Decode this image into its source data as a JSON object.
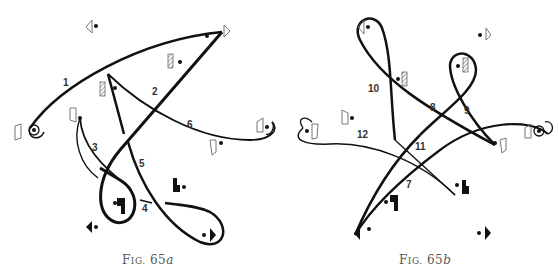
{
  "figures": [
    {
      "id": "a",
      "caption": {
        "prefix": "F",
        "smallcaps": "IG.",
        "number": "65",
        "suffix": "a"
      },
      "paths": [
        {
          "label": "1"
        },
        {
          "label": "2"
        },
        {
          "label": "3"
        },
        {
          "label": "4"
        },
        {
          "label": "5"
        },
        {
          "label": "6"
        }
      ]
    },
    {
      "id": "b",
      "caption": {
        "prefix": "F",
        "smallcaps": "IG.",
        "number": "65",
        "suffix": "b"
      },
      "paths": [
        {
          "label": "7"
        },
        {
          "label": "8"
        },
        {
          "label": "9"
        },
        {
          "label": "10"
        },
        {
          "label": "11"
        },
        {
          "label": "12"
        }
      ]
    }
  ],
  "colors": {
    "ink": "#111111",
    "caption": "#555555",
    "figure_outline": "#555555"
  }
}
